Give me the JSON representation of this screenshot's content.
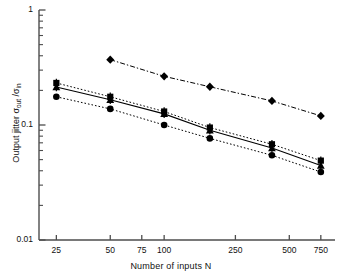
{
  "chart_data": {
    "type": "line",
    "title": "",
    "xlabel": "Number of inputs N",
    "ylabel": "Output jitter σout /σin",
    "ylabel_parts": {
      "prefix": "Output jitter σ",
      "sub1": "out",
      "mid": " /σ",
      "sub2": "in"
    },
    "xscale": "log",
    "yscale": "log",
    "xlim": [
      20,
      900
    ],
    "ylim": [
      0.01,
      1
    ],
    "grid": false,
    "legend": "none",
    "xticks": [
      25,
      50,
      75,
      100,
      250,
      500,
      750
    ],
    "xtick_labels": [
      "25",
      "50",
      "75",
      "100",
      "250",
      "500",
      "750"
    ],
    "yticks": [
      0.01,
      0.1,
      1
    ],
    "ytick_labels": [
      "0.01",
      "0.1",
      "1"
    ],
    "axis_color": "#4d4d4d",
    "marker_color": "#000000",
    "series": [
      {
        "name": "diamond-series",
        "marker": "diamond",
        "linestyle": "dashdot",
        "x": [
          50,
          100,
          180,
          400,
          750
        ],
        "values": [
          0.37,
          0.265,
          0.215,
          0.162,
          0.12
        ]
      },
      {
        "name": "square-series",
        "marker": "square",
        "linestyle": "dotted",
        "x": [
          25,
          50,
          100,
          180,
          400,
          750
        ],
        "values": [
          0.232,
          0.176,
          0.131,
          0.095,
          0.068,
          0.049
        ]
      },
      {
        "name": "triangle-series",
        "marker": "triangle",
        "linestyle": "solid",
        "x": [
          25,
          50,
          100,
          180,
          400,
          750
        ],
        "values": [
          0.214,
          0.166,
          0.125,
          0.09,
          0.063,
          0.0445
        ]
      },
      {
        "name": "circle-series",
        "marker": "circle",
        "linestyle": "dotted",
        "x": [
          25,
          50,
          100,
          180,
          400,
          750
        ],
        "values": [
          0.176,
          0.138,
          0.1,
          0.0765,
          0.0545,
          0.039
        ]
      }
    ]
  }
}
